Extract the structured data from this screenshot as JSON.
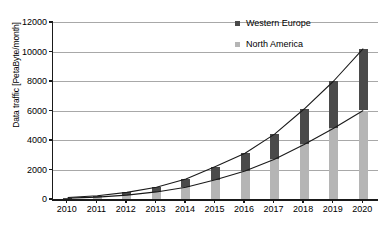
{
  "chart_data": {
    "type": "bar",
    "title": "",
    "subtitle": "",
    "xlabel": "",
    "ylabel": "Data traffic [PetaByte/month]",
    "categories": [
      "2010",
      "2011",
      "2012",
      "2013",
      "2014",
      "2015",
      "2016",
      "2017",
      "2018",
      "2019",
      "2020"
    ],
    "series": [
      {
        "name": "North America",
        "color": "#b5b5b5",
        "values": [
          60,
          130,
          260,
          480,
          800,
          1300,
          1900,
          2700,
          3700,
          4800,
          6000
        ]
      },
      {
        "name": "Western Europe",
        "color": "#4a4a4a",
        "values": [
          40,
          90,
          190,
          320,
          550,
          900,
          1200,
          1700,
          2400,
          3200,
          4200
        ]
      }
    ],
    "stacked": true,
    "stack_totals": [
      100,
      220,
      450,
      800,
      1350,
      2200,
      3100,
      4400,
      6100,
      8000,
      10200
    ],
    "ylim": [
      0,
      12000
    ],
    "yticks": [
      0,
      2000,
      4000,
      6000,
      8000,
      10000,
      12000
    ],
    "ytick_labels": [
      "0",
      "2000",
      "4000",
      "6000",
      "8000",
      "10000",
      "12000"
    ],
    "grid": true,
    "grid_axis": "y",
    "legend_position": "top-right",
    "overlay_lines": [
      {
        "name": "North America trend",
        "values": [
          60,
          130,
          260,
          480,
          800,
          1300,
          1900,
          2700,
          3700,
          4800,
          6000
        ]
      },
      {
        "name": "Total trend",
        "values": [
          100,
          220,
          450,
          800,
          1350,
          2200,
          3100,
          4400,
          6100,
          8000,
          10200
        ]
      }
    ]
  },
  "legend": {
    "items": [
      {
        "label": "Western Europe",
        "color": "#4a4a4a"
      },
      {
        "label": "North America",
        "color": "#b5b5b5"
      }
    ]
  },
  "axes": {
    "y_title": "Data traffic [PetaByte/month]"
  }
}
